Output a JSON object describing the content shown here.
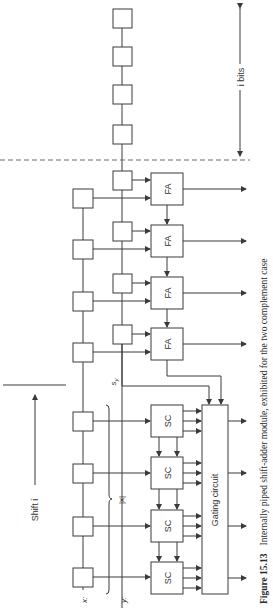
{
  "figure": {
    "caption_number": "Figure 15.13",
    "caption_text": "Internally piped shift-adder module, exhibited for the two complement case",
    "orientation": "rotated 90 degrees counter-clockwise"
  },
  "labels": {
    "i_bits": "i bits",
    "shift": "Shift i",
    "x_input": "x:",
    "y_input": "y:",
    "abs_x": "|x|",
    "sign": "s",
    "sign_sub": "y"
  },
  "blocks": {
    "full_adder": "FA",
    "sign_complement": "SC",
    "gating": "Gating circuit"
  },
  "colors": {
    "line": "#3a3a3a",
    "background": "#ffffff",
    "dashed": "#6a6a6a"
  }
}
